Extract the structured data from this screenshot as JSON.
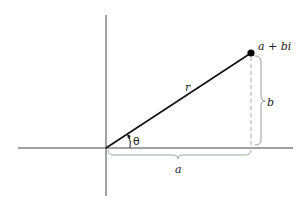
{
  "diagram": {
    "point_label": "a + bi",
    "radius_label": "r",
    "angle_label": "θ",
    "real_label": "a",
    "imag_label": "b",
    "colors": {
      "axis": "#333333",
      "line": "#111111",
      "dashed": "#999999",
      "brace": "#888888"
    }
  }
}
